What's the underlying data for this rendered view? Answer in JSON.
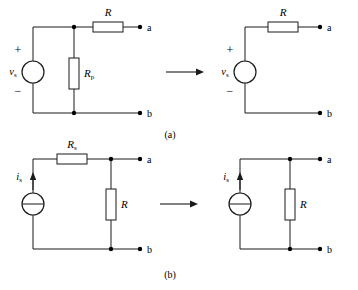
{
  "figure": {
    "captions": [
      {
        "id": "caption-a",
        "text": "(a)"
      },
      {
        "id": "caption-b",
        "text": "(b)"
      }
    ]
  },
  "terminals": {
    "a": "a",
    "b": "b"
  },
  "signs": {
    "plus": "+",
    "minus": "−"
  },
  "part_a": {
    "caption": "(a)",
    "left_circuit": {
      "source": {
        "type": "voltage-source",
        "symbol": "circle",
        "label_main": "v",
        "label_sub": "s",
        "polarity_top": "+",
        "polarity_bottom": "−"
      },
      "parallel_resistor": {
        "label_main": "R",
        "label_sub": "p",
        "orientation": "vertical"
      },
      "series_resistor": {
        "label_main": "R",
        "label_sub": "",
        "orientation": "horizontal"
      },
      "terminal_top": "a",
      "terminal_bottom": "b"
    },
    "right_circuit": {
      "source": {
        "type": "voltage-source",
        "symbol": "circle",
        "label_main": "v",
        "label_sub": "s",
        "polarity_top": "+",
        "polarity_bottom": "−"
      },
      "series_resistor": {
        "label_main": "R",
        "label_sub": "",
        "orientation": "horizontal"
      },
      "terminal_top": "a",
      "terminal_bottom": "b"
    },
    "transform_arrow": "→"
  },
  "part_b": {
    "caption": "(b)",
    "left_circuit": {
      "source": {
        "type": "current-source",
        "symbol": "circle-with-bar",
        "label_main": "i",
        "label_sub": "s",
        "arrow_direction": "up"
      },
      "series_resistor": {
        "label_main": "R",
        "label_sub": "s",
        "orientation": "horizontal"
      },
      "parallel_resistor": {
        "label_main": "R",
        "label_sub": "",
        "orientation": "vertical"
      },
      "terminal_top": "a",
      "terminal_bottom": "b"
    },
    "right_circuit": {
      "source": {
        "type": "current-source",
        "symbol": "circle-with-bar",
        "label_main": "i",
        "label_sub": "s",
        "arrow_direction": "up"
      },
      "parallel_resistor": {
        "label_main": "R",
        "label_sub": "",
        "orientation": "vertical"
      },
      "terminal_top": "a",
      "terminal_bottom": "b"
    },
    "transform_arrow": "→"
  },
  "colors": {
    "line": "#1a1a1a",
    "background": "#ffffff",
    "text": "#000000"
  }
}
